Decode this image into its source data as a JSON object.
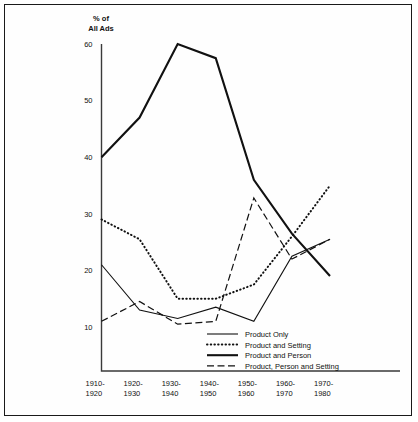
{
  "chart_data": {
    "type": "line",
    "title": "",
    "ylabel_lines": [
      "% of",
      "All Ads"
    ],
    "xlabel": "",
    "grid": false,
    "legend_position": "inside-bottom-right",
    "ylim": [
      5,
      62
    ],
    "yticks": [
      10,
      20,
      30,
      40,
      50,
      60
    ],
    "ytick_labels": [
      "10",
      "20",
      "30",
      "40",
      "50",
      "60"
    ],
    "categories": [
      "1910-\n1920",
      "1920-\n1930",
      "1930-\n1940",
      "1940-\n1950",
      "1950-\n1960",
      "1960-\n1970",
      "1970-\n1980"
    ],
    "xtick_labels_top": [
      "1910-",
      "1920-",
      "1930-",
      "1940-",
      "1950-",
      "1960-",
      "1970-"
    ],
    "xtick_labels_bottom": [
      "1920",
      "1930",
      "1940",
      "1950",
      "1960",
      "1970",
      "1980"
    ],
    "series": [
      {
        "name": "Product Only",
        "style": "solid-thin",
        "stroke_width": 1.1,
        "dash": "none",
        "values": [
          21,
          13,
          11.5,
          13.5,
          11,
          22.5,
          25.5
        ]
      },
      {
        "name": "Product and Setting",
        "style": "dotted",
        "stroke_width": 2.0,
        "dash": "0.5,3.2",
        "values": [
          29,
          25.5,
          15,
          15,
          17.5,
          26,
          35
        ]
      },
      {
        "name": "Product and Person",
        "style": "solid-thick",
        "stroke_width": 2.1,
        "dash": "none",
        "values": [
          40,
          47,
          60,
          57.5,
          36,
          26.5,
          19
        ]
      },
      {
        "name": "Product, Person and Setting",
        "style": "dashed",
        "stroke_width": 1.2,
        "dash": "7,3.5",
        "values": [
          11,
          14.5,
          10.5,
          11,
          32.8,
          22,
          25.5
        ]
      }
    ]
  },
  "legend": {
    "entries": [
      {
        "label": "Product Only",
        "sample": "solid-thin"
      },
      {
        "label": "Product and Setting",
        "sample": "dotted"
      },
      {
        "label": "Product and Person",
        "sample": "solid-thick"
      },
      {
        "label": "Product, Person and Setting",
        "sample": "dashed"
      }
    ]
  },
  "colors": {
    "ink": "#111111",
    "axis": "#3a3a3a",
    "frame": "#1a1a1a",
    "background": "#ffffff"
  }
}
